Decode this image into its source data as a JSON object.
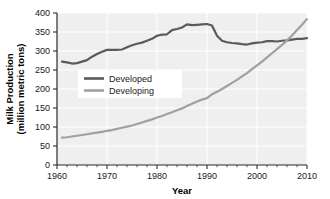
{
  "chart_data": {
    "type": "line",
    "title": "",
    "xlabel": "Year",
    "ylabel": "Milk Production (million metric tons)",
    "ylabel_line1": "Milk Production",
    "ylabel_line2": "(million metric tons)",
    "xlim": [
      1960,
      2010
    ],
    "ylim": [
      0,
      400
    ],
    "xticks": [
      1960,
      1970,
      1980,
      1990,
      2000,
      2010
    ],
    "xtick_labels": [
      "1960",
      "1970",
      "1980",
      "1990",
      "2000",
      "2010"
    ],
    "yticks": [
      0,
      50,
      100,
      150,
      200,
      250,
      300,
      350,
      400
    ],
    "ytick_labels": [
      "0",
      "50",
      "100",
      "150",
      "200",
      "250",
      "300",
      "350",
      "400"
    ],
    "x_minor_tick_interval": 2,
    "grid": true,
    "grid_color": "#ffffff",
    "plot_background": "#efefef",
    "legend_position": "center-left",
    "series": [
      {
        "name": "Developed",
        "color": "#5a5a5a",
        "x": [
          1961,
          1962,
          1963,
          1964,
          1965,
          1966,
          1967,
          1968,
          1969,
          1970,
          1971,
          1972,
          1973,
          1974,
          1975,
          1976,
          1977,
          1978,
          1979,
          1980,
          1981,
          1982,
          1983,
          1984,
          1985,
          1986,
          1987,
          1988,
          1989,
          1990,
          1991,
          1992,
          1993,
          1994,
          1995,
          1996,
          1997,
          1998,
          1999,
          2000,
          2001,
          2002,
          2003,
          2004,
          2005,
          2006,
          2007,
          2008,
          2009,
          2010
        ],
        "values": [
          272,
          270,
          267,
          268,
          272,
          276,
          285,
          292,
          298,
          303,
          303,
          303,
          304,
          310,
          315,
          319,
          322,
          327,
          332,
          340,
          343,
          344,
          355,
          358,
          362,
          370,
          368,
          369,
          370,
          371,
          367,
          340,
          327,
          323,
          321,
          320,
          318,
          317,
          320,
          322,
          323,
          326,
          326,
          325,
          327,
          328,
          330,
          332,
          332,
          334
        ],
        "linewidth": 2.2
      },
      {
        "name": "Developing",
        "color": "#a0a0a0",
        "x": [
          1961,
          1962,
          1963,
          1964,
          1965,
          1966,
          1967,
          1968,
          1969,
          1970,
          1971,
          1972,
          1973,
          1974,
          1975,
          1976,
          1977,
          1978,
          1979,
          1980,
          1981,
          1982,
          1983,
          1984,
          1985,
          1986,
          1987,
          1988,
          1989,
          1990,
          1991,
          1992,
          1993,
          1994,
          1995,
          1996,
          1997,
          1998,
          1999,
          2000,
          2001,
          2002,
          2003,
          2004,
          2005,
          2006,
          2007,
          2008,
          2009,
          2010
        ],
        "values": [
          72,
          73,
          75,
          77,
          79,
          81,
          83,
          85,
          87,
          90,
          92,
          95,
          98,
          101,
          104,
          108,
          112,
          116,
          120,
          125,
          129,
          134,
          139,
          144,
          149,
          155,
          161,
          167,
          172,
          176,
          186,
          193,
          200,
          208,
          216,
          224,
          233,
          242,
          252,
          262,
          272,
          283,
          294,
          305,
          316,
          328,
          341,
          355,
          369,
          384
        ],
        "linewidth": 2.2
      }
    ],
    "annotations": []
  },
  "legend": {
    "items": [
      {
        "label": "Developed",
        "color": "#5a5a5a"
      },
      {
        "label": "Developing",
        "color": "#a0a0a0"
      }
    ]
  }
}
